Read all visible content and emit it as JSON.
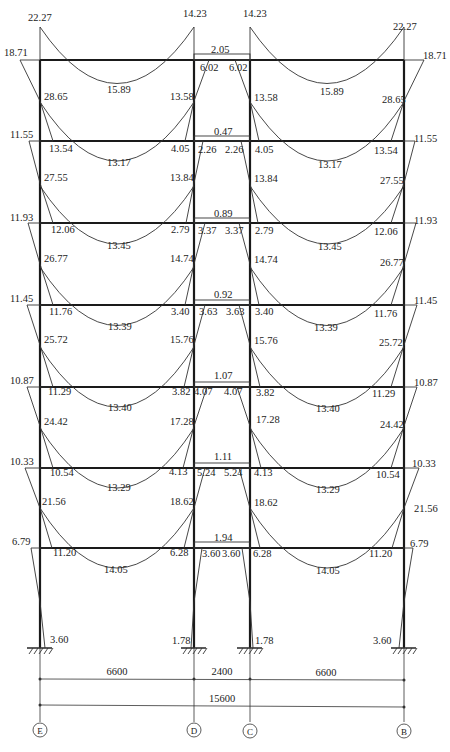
{
  "axes": [
    {
      "label": "E",
      "x": 40
    },
    {
      "label": "D",
      "x": 194
    },
    {
      "label": "C",
      "x": 250
    },
    {
      "label": "B",
      "x": 404
    }
  ],
  "floor_levels_y": [
    60,
    141,
    223,
    305,
    387,
    468,
    548
  ],
  "base_y": 648,
  "dimensions": {
    "spans": [
      "6600",
      "2400",
      "6600"
    ],
    "total": "15600"
  },
  "floors": [
    {
      "level": 7,
      "side_beam": {
        "left_end": "22.27",
        "mid": "15.89",
        "right_end": "14.23"
      },
      "mid_beam": {
        "mid": "2.05",
        "end": "6.02"
      },
      "outer_col_top": "18.71",
      "outer_col_bottom": "28.65",
      "inner_col_bottom": "13.58"
    },
    {
      "level": 6,
      "side_beam": {
        "left_end": "13.54",
        "mid": "13.17",
        "right_end": "4.05"
      },
      "mid_beam": {
        "mid": "0.47",
        "end": "2.26"
      },
      "outer_col_top": "11.55",
      "outer_col_bottom": "27.55",
      "inner_col_bottom": "13.84"
    },
    {
      "level": 5,
      "side_beam": {
        "left_end": "12.06",
        "mid": "13.45",
        "right_end": "2.79"
      },
      "mid_beam": {
        "mid": "0.89",
        "end": "3.37"
      },
      "outer_col_top": "11.93",
      "outer_col_bottom": "26.77",
      "inner_col_bottom": "14.74"
    },
    {
      "level": 4,
      "side_beam": {
        "left_end": "11.76",
        "mid": "13.39",
        "right_end": "3.40"
      },
      "mid_beam": {
        "mid": "0.92",
        "end": "3.63"
      },
      "outer_col_top": "11.45",
      "outer_col_bottom": "25.72",
      "inner_col_bottom": "15.76"
    },
    {
      "level": 3,
      "side_beam": {
        "left_end": "11.29",
        "mid": "13.40",
        "right_end": "3.82"
      },
      "mid_beam": {
        "mid": "1.07",
        "end": "4.07"
      },
      "outer_col_top": "10.87",
      "outer_col_bottom": "24.42",
      "inner_col_bottom": "17.28"
    },
    {
      "level": 2,
      "side_beam": {
        "left_end": "10.54",
        "mid": "13.29",
        "right_end": "4.13"
      },
      "mid_beam": {
        "mid": "1.11",
        "end": "5.24"
      },
      "outer_col_top": "10.33",
      "outer_col_bottom": "21.56",
      "inner_col_bottom": "18.62"
    },
    {
      "level": 1,
      "side_beam": {
        "left_end": "11.20",
        "mid": "14.05",
        "right_end": "6.28"
      },
      "mid_beam": {
        "mid": "1.94",
        "end": "3.60"
      },
      "outer_col_top": "6.79",
      "outer_col_bottom": "",
      "inner_col_bottom": ""
    }
  ],
  "bases": {
    "outer": "3.60",
    "inner": "1.78"
  },
  "labels": {
    "top_left_end": "22.27",
    "top_right_end": "22.27",
    "top_inner_left": "14.23",
    "top_inner_right": "14.23",
    "roof_outer_left": "18.71",
    "roof_outer_right": "18.71",
    "roof_mid": "2.05",
    "roof_mid_end_left": "6.02",
    "roof_mid_end_right": "6.02",
    "roof_span_mid_left": "15.89",
    "roof_span_mid_right": "15.89",
    "f7_outer_col_left": "28.65",
    "f7_outer_col_right": "28.65",
    "f7_inner_col_left": "13.58",
    "f7_inner_col_right": "13.58",
    "f6_outer_left": "11.55",
    "f6_outer_right": "11.55",
    "f6_beam_end_left": "13.54",
    "f6_beam_end_right": "13.54",
    "f6_beam_inner_left": "4.05",
    "f6_beam_inner_right": "4.05",
    "f6_mid_beam": "0.47",
    "f6_mid_end_left": "2.26",
    "f6_mid_end_right": "2.26",
    "f6_span_mid_left": "13.17",
    "f6_span_mid_right": "13.17",
    "f6_outer_col_left": "27.55",
    "f6_outer_col_right": "27.55",
    "f6_inner_col_left": "13.84",
    "f6_inner_col_right": "13.84",
    "f5_outer_left": "11.93",
    "f5_outer_right": "11.93",
    "f5_beam_end_left": "12.06",
    "f5_beam_end_right": "12.06",
    "f5_beam_inner_left": "2.79",
    "f5_beam_inner_right": "2.79",
    "f5_mid_beam": "0.89",
    "f5_mid_end_left": "3.37",
    "f5_mid_end_right": "3.37",
    "f5_span_mid_left": "13.45",
    "f5_span_mid_right": "13.45",
    "f5_outer_col_left": "26.77",
    "f5_outer_col_right": "26.77",
    "f5_inner_col_left": "14.74",
    "f5_inner_col_right": "14.74",
    "f4_outer_left": "11.45",
    "f4_outer_right": "11.45",
    "f4_beam_end_left": "11.76",
    "f4_beam_end_right": "11.76",
    "f4_beam_inner_left": "3.40",
    "f4_beam_inner_right": "3.40",
    "f4_mid_beam": "0.92",
    "f4_mid_end_left": "3.63",
    "f4_mid_end_right": "3.63",
    "f4_span_mid_left": "13.39",
    "f4_span_mid_right": "13.39",
    "f4_outer_col_left": "25.72",
    "f4_outer_col_right": "25.72",
    "f4_inner_col_left": "15.76",
    "f4_inner_col_right": "15.76",
    "f3_outer_left": "10.87",
    "f3_outer_right": "10.87",
    "f3_beam_end_left": "11.29",
    "f3_beam_end_right": "11.29",
    "f3_beam_inner_left": "3.82",
    "f3_beam_inner_right": "3.82",
    "f3_mid_beam": "1.07",
    "f3_mid_end_left": "4.07",
    "f3_mid_end_right": "4.07",
    "f3_span_mid_left": "13.40",
    "f3_span_mid_right": "13.40",
    "f3_outer_col_left": "24.42",
    "f3_outer_col_right": "24.42",
    "f3_inner_col_left": "17.28",
    "f3_inner_col_right": "17.28",
    "f2_outer_left": "10.33",
    "f2_outer_right": "10.33",
    "f2_beam_end_left": "10.54",
    "f2_beam_end_right": "10.54",
    "f2_beam_inner_left": "4.13",
    "f2_beam_inner_right": "4.13",
    "f2_mid_beam": "1.11",
    "f2_mid_end_left": "5.24",
    "f2_mid_end_right": "5.24",
    "f2_span_mid_left": "13.29",
    "f2_span_mid_right": "13.29",
    "f2_outer_col_left": "21.56",
    "f2_outer_col_right": "21.56",
    "f2_inner_col_left": "18.62",
    "f2_inner_col_right": "18.62",
    "f1_outer_left": "6.79",
    "f1_outer_right": "6.79",
    "f1_beam_end_left": "11.20",
    "f1_beam_end_right": "11.20",
    "f1_beam_inner_left": "6.28",
    "f1_beam_inner_right": "6.28",
    "f1_mid_beam": "1.94",
    "f1_mid_end_left": "3.60",
    "f1_mid_end_right": "3.60",
    "f1_span_mid_left": "14.05",
    "f1_span_mid_right": "14.05",
    "base_outer_left": "3.60",
    "base_outer_right": "3.60",
    "base_inner_left": "1.78",
    "base_inner_right": "1.78",
    "dim_span_1": "6600",
    "dim_span_2": "2400",
    "dim_span_3": "6600",
    "dim_total": "15600",
    "axis_E": "E",
    "axis_D": "D",
    "axis_C": "C",
    "axis_B": "B"
  }
}
